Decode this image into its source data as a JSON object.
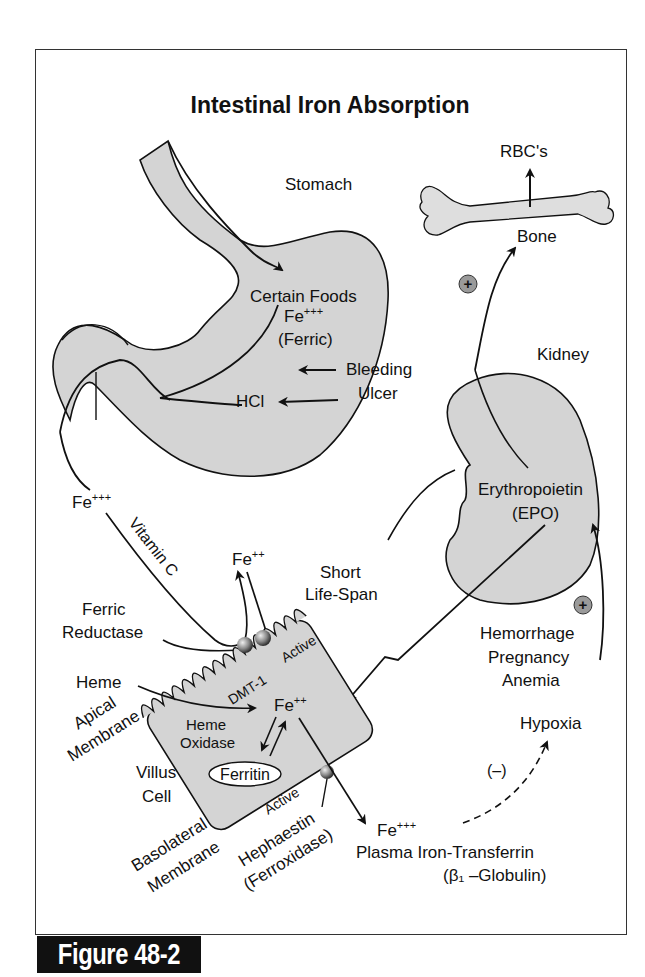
{
  "title": "Intestinal Iron Absorption",
  "figure_label": "Figure 48-2",
  "labels": {
    "stomach": "Stomach",
    "certain_foods": "Certain Foods",
    "fe3_stomach": "Fe",
    "fe3_stomach_sup": "+++",
    "ferric": "(Ferric)",
    "bleeding": "Bleeding",
    "ulcer": "Ulcer",
    "hcl": "HCl",
    "rbcs": "RBC's",
    "bone": "Bone",
    "kidney": "Kidney",
    "erythropoietin": "Erythropoietin",
    "epo": "(EPO)",
    "fe3_left": "Fe",
    "fe3_left_sup": "+++",
    "vitamin_c": "Vitamin C",
    "fe2_top": "Fe",
    "fe2_top_sup": "++",
    "short": "Short",
    "life_span": "Life-Span",
    "ferric_label": "Ferric",
    "reductase": "Reductase",
    "heme": "Heme",
    "apical": "Apical",
    "membrane_apical": "Membrane",
    "dmt1": "DMT-1",
    "active_top": "Active",
    "fe2_cell": "Fe",
    "fe2_cell_sup": "++",
    "heme_oxidase_1": "Heme",
    "heme_oxidase_2": "Oxidase",
    "ferritin": "Ferritin",
    "villus": "Villus",
    "cell": "Cell",
    "active_bottom": "Active",
    "basolateral": "Basolateral",
    "membrane_baso": "Membrane",
    "hephaestin": "Hephaestin",
    "ferroxidase": "(Ferroxidase)",
    "fe3_plasma": "Fe",
    "fe3_plasma_sup": "+++",
    "plasma_transferrin": "Plasma Iron-Transferrin",
    "globulin": "(β₁ –Globulin)",
    "hemorrhage": "Hemorrhage",
    "pregnancy": "Pregnancy",
    "anemia": "Anemia",
    "hypoxia": "Hypoxia",
    "negative": "(–)",
    "plus": "+"
  },
  "colors": {
    "organ_fill": "#d4d4d4",
    "stroke": "#111111",
    "plus_circle_fill": "#9a9a9a",
    "label_bg": "#111111",
    "label_text": "#ffffff"
  }
}
